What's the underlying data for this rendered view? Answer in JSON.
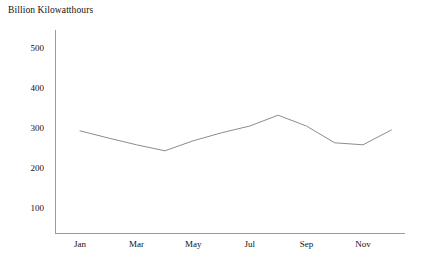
{
  "chart_data": {
    "type": "line",
    "title": "Billion Kilowatthours",
    "xlabel": "",
    "ylabel": "",
    "ylim": [
      0,
      550
    ],
    "yticks": [
      100,
      200,
      300,
      400,
      500
    ],
    "ytick_labels": [
      "100",
      "200",
      "300",
      "400",
      "500"
    ],
    "grid": false,
    "legend": "none",
    "categories": [
      "Jan",
      "Feb",
      "Mar",
      "Apr",
      "May",
      "Jun",
      "Jul",
      "Aug",
      "Sep",
      "Oct",
      "Nov",
      "Dec"
    ],
    "xtick_labels": [
      "Jan",
      "Mar",
      "May",
      "Jul",
      "Sep",
      "Nov"
    ],
    "xtick_categories": [
      "Jan",
      "Mar",
      "May",
      "Jul",
      "Sep",
      "Nov"
    ],
    "values": [
      293,
      275,
      258,
      243,
      268,
      288,
      305,
      332,
      305,
      263,
      258,
      295
    ],
    "series": [
      {
        "name": "Net electricity generation",
        "values": [
          293,
          275,
          258,
          243,
          268,
          288,
          305,
          332,
          305,
          263,
          258,
          295
        ]
      }
    ],
    "line_color": "#8c8c8c",
    "axis_color": "#9a9a9a",
    "text_color": "#111111",
    "background_color": "#ffffff"
  }
}
